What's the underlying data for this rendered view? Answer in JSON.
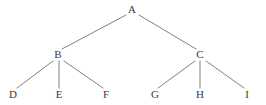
{
  "diagram": {
    "type": "tree",
    "background_color": "#ffffff",
    "edge_color": "#808080",
    "label_color": "#3a3a3a",
    "edge_width": 1,
    "nodes": [
      {
        "id": "A",
        "label": "A",
        "x": 132,
        "y": 10,
        "level": 0
      },
      {
        "id": "B",
        "label": "B",
        "x": 58,
        "y": 55,
        "level": 1
      },
      {
        "id": "C",
        "label": "C",
        "x": 200,
        "y": 55,
        "level": 1
      },
      {
        "id": "D",
        "label": "D",
        "x": 13,
        "y": 95,
        "level": 2
      },
      {
        "id": "E",
        "label": "E",
        "x": 59,
        "y": 95,
        "level": 2
      },
      {
        "id": "F",
        "label": "F",
        "x": 106,
        "y": 95,
        "level": 2
      },
      {
        "id": "G",
        "label": "G",
        "x": 155,
        "y": 95,
        "level": 2
      },
      {
        "id": "H",
        "label": "H",
        "x": 200,
        "y": 95,
        "level": 2
      },
      {
        "id": "I",
        "label": "I",
        "x": 247,
        "y": 95,
        "level": 2
      }
    ],
    "edges": [
      {
        "from": "A",
        "to": "B",
        "x1": 126,
        "y1": 15,
        "x2": 62,
        "y2": 49
      },
      {
        "from": "A",
        "to": "C",
        "x1": 139,
        "y1": 15,
        "x2": 196,
        "y2": 49
      },
      {
        "from": "B",
        "to": "D",
        "x1": 53,
        "y1": 61,
        "x2": 17,
        "y2": 88
      },
      {
        "from": "B",
        "to": "E",
        "x1": 59,
        "y1": 61,
        "x2": 59,
        "y2": 88
      },
      {
        "from": "B",
        "to": "F",
        "x1": 64,
        "y1": 61,
        "x2": 103,
        "y2": 88
      },
      {
        "from": "C",
        "to": "G",
        "x1": 195,
        "y1": 61,
        "x2": 158,
        "y2": 88
      },
      {
        "from": "C",
        "to": "H",
        "x1": 200,
        "y1": 61,
        "x2": 200,
        "y2": 88
      },
      {
        "from": "C",
        "to": "I",
        "x1": 206,
        "y1": 61,
        "x2": 244,
        "y2": 88
      }
    ]
  }
}
